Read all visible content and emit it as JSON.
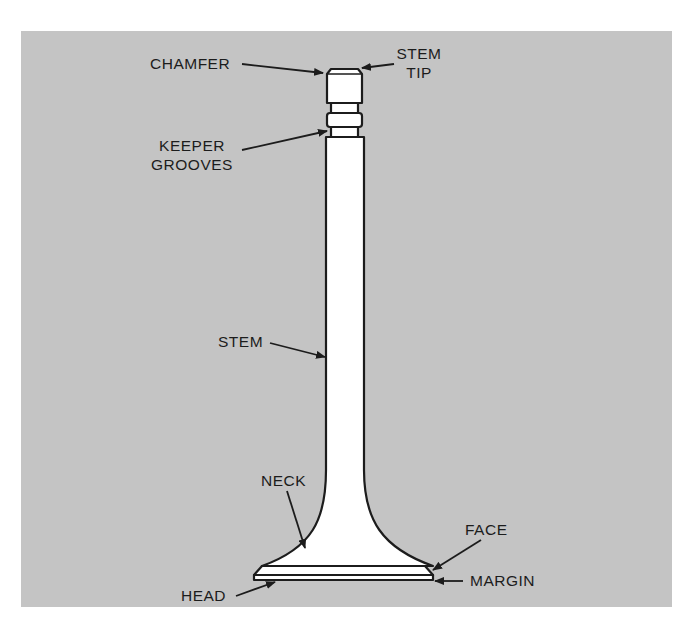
{
  "figure": {
    "colors": {
      "background": "#c4c4c4",
      "part_fill": "#ffffff",
      "ink": "#1c1c1c"
    }
  },
  "labels": {
    "chamfer": "CHAMFER",
    "stem_tip_line1": "STEM",
    "stem_tip_line2": "TIP",
    "keeper_grooves_line1": "KEEPER",
    "keeper_grooves_line2": "GROOVES",
    "stem": "STEM",
    "neck": "NECK",
    "face": "FACE",
    "head": "HEAD",
    "margin": "MARGIN"
  }
}
